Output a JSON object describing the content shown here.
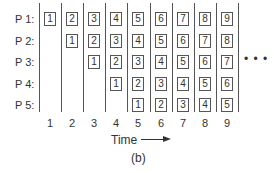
{
  "figure": {
    "rows": [
      {
        "label": "P 1:",
        "start": 1
      },
      {
        "label": "P 2:",
        "start": 2
      },
      {
        "label": "P 3:",
        "start": 3
      },
      {
        "label": "P 4:",
        "start": 4
      },
      {
        "label": "P 5:",
        "start": 5
      }
    ],
    "time_ticks": [
      "1",
      "2",
      "3",
      "4",
      "5",
      "6",
      "7",
      "8",
      "9"
    ],
    "cells": [
      [
        "1",
        "2",
        "3",
        "4",
        "5",
        "6",
        "7",
        "8",
        "9"
      ],
      [
        "",
        "1",
        "2",
        "3",
        "4",
        "5",
        "6",
        "7",
        "8"
      ],
      [
        "",
        "",
        "1",
        "2",
        "3",
        "4",
        "5",
        "6",
        "7"
      ],
      [
        "",
        "",
        "",
        "1",
        "2",
        "3",
        "4",
        "5",
        "6"
      ],
      [
        "",
        "",
        "",
        "",
        "1",
        "2",
        "3",
        "4",
        "5"
      ]
    ],
    "continuation": "• • •",
    "axis_label": "Time",
    "caption": "(b)"
  }
}
